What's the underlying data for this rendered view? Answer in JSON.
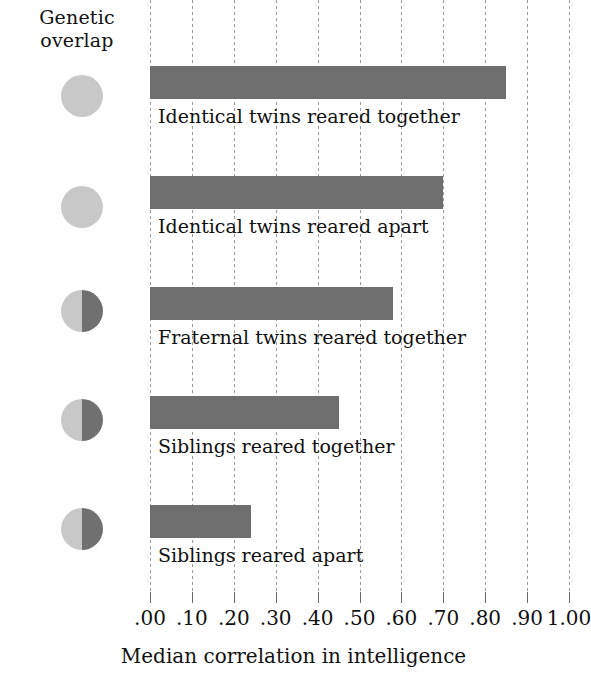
{
  "header": {
    "overlap_label_line1": "Genetic",
    "overlap_label_line2": "overlap"
  },
  "colors": {
    "bar_fill": "#6e6e6e",
    "circle_light": "#c8c8c8",
    "circle_dark": "#707070",
    "gridline": "#9a9a9a",
    "text": "#111111"
  },
  "axis": {
    "title": "Median correlation in intelligence",
    "tick_labels": [
      ".00",
      ".10",
      ".20",
      ".30",
      ".40",
      ".50",
      ".60",
      ".70",
      ".80",
      ".90",
      "1.00"
    ],
    "tick_values": [
      0,
      0.1,
      0.2,
      0.3,
      0.4,
      0.5,
      0.6,
      0.7,
      0.8,
      0.9,
      1.0
    ],
    "min": 0,
    "max": 1.0
  },
  "chart_data": {
    "type": "bar",
    "orientation": "horizontal",
    "title": "",
    "xlabel": "Median correlation in intelligence",
    "ylabel": "",
    "xlim": [
      0,
      1.0
    ],
    "grid": true,
    "legend": "none",
    "categories": [
      "Identical twins reared together",
      "Identical twins reared apart",
      "Fraternal twins reared together",
      "Siblings reared together",
      "Siblings reared apart"
    ],
    "values": [
      0.85,
      0.7,
      0.58,
      0.45,
      0.24
    ],
    "genetic_overlap_percent": [
      100,
      100,
      50,
      50,
      50
    ],
    "annotations": [
      "Genetic overlap"
    ]
  },
  "rows": [
    {
      "caption": "Identical twins reared together",
      "value": 0.85,
      "overlap": 100,
      "icon": "full-circle-icon"
    },
    {
      "caption": "Identical twins reared apart",
      "value": 0.7,
      "overlap": 100,
      "icon": "full-circle-icon"
    },
    {
      "caption": "Fraternal twins reared together",
      "value": 0.58,
      "overlap": 50,
      "icon": "half-circle-icon"
    },
    {
      "caption": "Siblings reared together",
      "value": 0.45,
      "overlap": 50,
      "icon": "half-circle-icon"
    },
    {
      "caption": "Siblings reared apart",
      "value": 0.24,
      "overlap": 50,
      "icon": "half-circle-icon"
    }
  ]
}
